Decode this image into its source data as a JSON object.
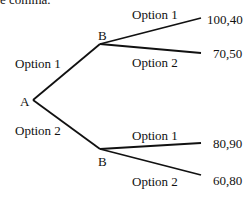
{
  "caption_fragment": "e comma.",
  "tree": {
    "root": {
      "label": "A"
    },
    "branches": [
      {
        "edge_label": "Option 1",
        "node": {
          "label": "B"
        },
        "children": [
          {
            "edge_label": "Option 1",
            "payoff": "100,40"
          },
          {
            "edge_label": "Option 2",
            "payoff": "70,50"
          }
        ]
      },
      {
        "edge_label": "Option 2",
        "node": {
          "label": "B"
        },
        "children": [
          {
            "edge_label": "Option 1",
            "payoff": "80,90"
          },
          {
            "edge_label": "Option 2",
            "payoff": "60,80"
          }
        ]
      }
    ]
  }
}
